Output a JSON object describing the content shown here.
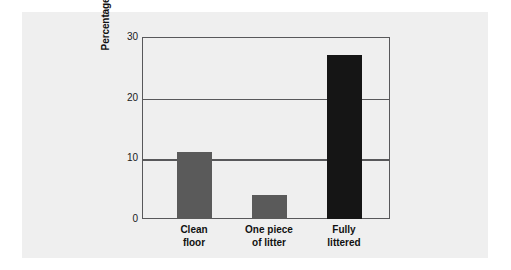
{
  "chart_data": {
    "type": "bar",
    "title": "",
    "subtitle": "",
    "xlabel": "",
    "ylabel": "Percentage of people who littered",
    "categories": [
      "Clean floor",
      "One piece of litter",
      "Fully littered"
    ],
    "category_lines": [
      [
        "Clean",
        "floor"
      ],
      [
        "One piece",
        "of litter"
      ],
      [
        "Fully",
        "littered"
      ]
    ],
    "values": [
      11,
      4,
      27
    ],
    "bar_colors": [
      "#5a5a5a",
      "#5a5a5a",
      "#151515"
    ],
    "ylim": [
      0,
      30
    ],
    "yticks": [
      0,
      10,
      20,
      30
    ],
    "ytick_labels": [
      "0",
      "10",
      "20",
      "30"
    ],
    "grid": true,
    "grid_axis": "y",
    "legend": false,
    "legend_position": "none"
  },
  "figure": {
    "panel_color": "#efefef",
    "background_color": "#ffffff",
    "axis_color": "#58585a",
    "text_color": "#111111"
  }
}
